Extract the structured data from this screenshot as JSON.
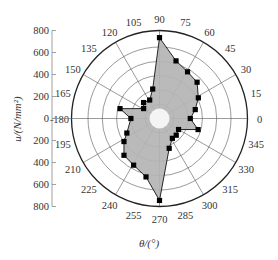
{
  "chart_data": {
    "type": "radar",
    "title": "",
    "xlabel": "θ/(°)",
    "ylabel": "u/(N/mm²)",
    "radial_axis": {
      "ticks": [
        800,
        600,
        400,
        200,
        0,
        200,
        400,
        600,
        800
      ],
      "range": [
        0,
        800
      ]
    },
    "angular_ticks": [
      0,
      15,
      30,
      45,
      60,
      75,
      90,
      105,
      120,
      135,
      150,
      165,
      180,
      195,
      210,
      225,
      240,
      255,
      270,
      285,
      300,
      315,
      330,
      345
    ],
    "angular_tick_labels": [
      "0",
      "15",
      "30",
      "45",
      "60",
      "75",
      "90",
      "105",
      "120",
      "135",
      "150",
      "165",
      "-180",
      "195",
      "210",
      "225",
      "240",
      "255",
      "270",
      "285",
      "300",
      "315",
      "330",
      "345"
    ],
    "rings": [
      130,
      260,
      390,
      520,
      650,
      800
    ],
    "spokes": [
      0,
      30,
      60,
      90,
      120,
      150,
      180,
      210,
      240,
      270,
      300,
      330
    ],
    "grid": true,
    "series": [
      {
        "name": "u",
        "fill": "#b4b4b4",
        "marker": "square",
        "points": [
          {
            "angle": 0,
            "value": 280
          },
          {
            "angle": 14,
            "value": 335
          },
          {
            "angle": 28,
            "value": 400
          },
          {
            "angle": 44,
            "value": 475
          },
          {
            "angle": 59,
            "value": 495
          },
          {
            "angle": 74,
            "value": 545
          },
          {
            "angle": 90,
            "value": 735
          },
          {
            "angle": 103,
            "value": 275
          },
          {
            "angle": 118,
            "value": 190
          },
          {
            "angle": 135,
            "value": 205
          },
          {
            "angle": 148,
            "value": 170
          },
          {
            "angle": 166,
            "value": 370
          },
          {
            "angle": 180,
            "value": 260
          },
          {
            "angle": 204,
            "value": 325
          },
          {
            "angle": 213,
            "value": 385
          },
          {
            "angle": 226,
            "value": 465
          },
          {
            "angle": 241,
            "value": 485
          },
          {
            "angle": 257,
            "value": 545
          },
          {
            "angle": 270,
            "value": 745
          },
          {
            "angle": 288,
            "value": 285
          },
          {
            "angle": 303,
            "value": 215
          },
          {
            "angle": 315,
            "value": 215
          },
          {
            "angle": 330,
            "value": 200
          },
          {
            "angle": 344,
            "value": 365
          }
        ]
      }
    ]
  },
  "colors": {
    "fill": "#b4b4b4",
    "line": "#111111",
    "grid": "#555555",
    "hub": "#f4f4f4"
  }
}
